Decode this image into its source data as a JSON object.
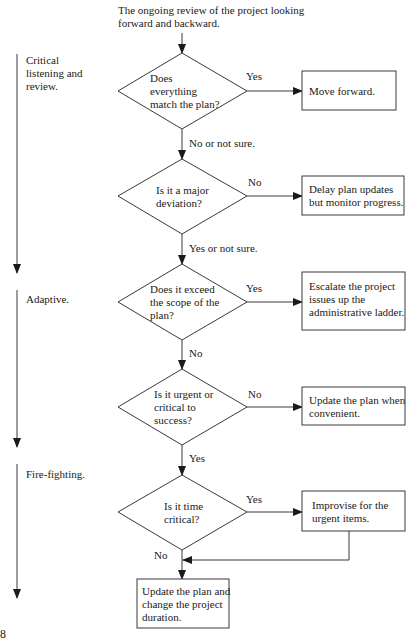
{
  "diagram": {
    "intro": "The ongoing review of the project looking\nforward and backward.",
    "phases": [
      {
        "label": "Critical\nlistening and\nreview."
      },
      {
        "label": "Adaptive."
      },
      {
        "label": "Fire-fighting."
      }
    ],
    "decisions": [
      {
        "question": "Does\neverything\nmatch the plan?",
        "side_label": "Yes",
        "down_label": "No or not sure."
      },
      {
        "question": "Is it a major\ndeviation?",
        "side_label": "No",
        "down_label": "Yes or not sure."
      },
      {
        "question": "Does it exceed\nthe scope of the\nplan?",
        "side_label": "Yes",
        "down_label": "No"
      },
      {
        "question": "Is it urgent or\ncritical to\nsuccess?",
        "side_label": "No",
        "down_label": "Yes"
      },
      {
        "question": "Is it time\ncritical?",
        "side_label": "Yes",
        "down_label": "No"
      }
    ],
    "actions": [
      {
        "text": "Move forward."
      },
      {
        "text": "Delay plan updates\nbut monitor progress."
      },
      {
        "text": "Escalate the project\nissues up the\nadministrative ladder."
      },
      {
        "text": "Update the plan when\nconvenient."
      },
      {
        "text": "Improvise for the\nurgent items."
      }
    ],
    "final_action": "Update the plan and\nchange the project\nduration.",
    "footer_glyph": "8",
    "colors": {
      "line": "#3a3a3a",
      "text": "#1a1a1a",
      "background": "#ffffff"
    }
  }
}
